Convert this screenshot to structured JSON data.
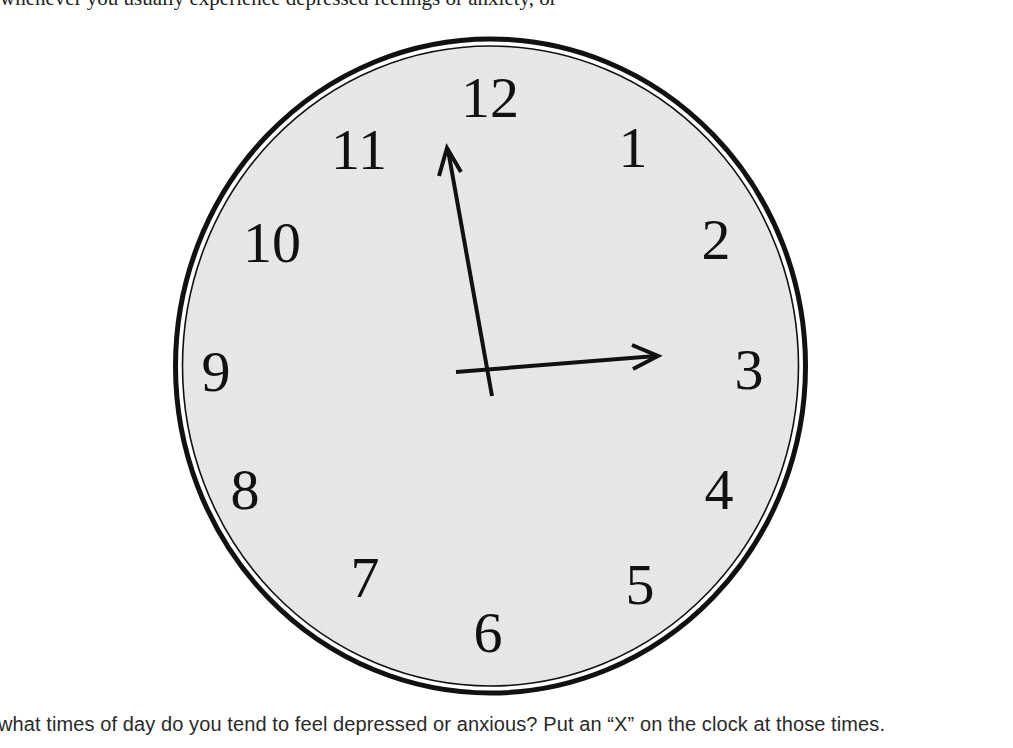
{
  "page": {
    "top_cutoff_text": "whenever you usually experience depressed feelings or anxiety, or",
    "question": "what times of day do you tend to feel depressed or anxious? Put an “X” on the clock at those times."
  },
  "clock": {
    "face_color": "#e6e6e6",
    "rim_color": "#111111",
    "numerals": [
      "12",
      "1",
      "2",
      "3",
      "4",
      "5",
      "6",
      "7",
      "8",
      "9",
      "10",
      "11"
    ],
    "time_shown": "2:57 (hands pointing near 12 and 3)"
  }
}
